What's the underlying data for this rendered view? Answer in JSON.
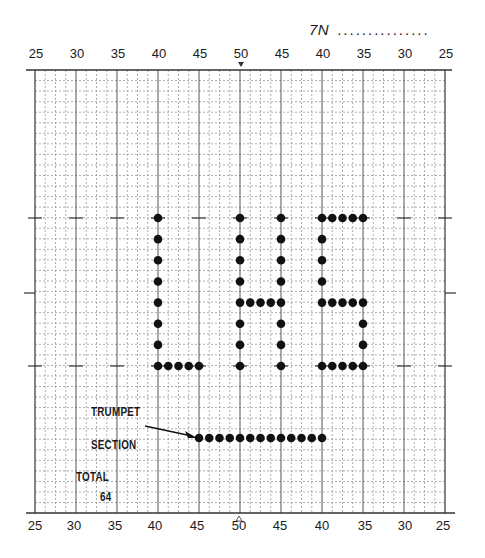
{
  "header": {
    "chart_id": "7N",
    "chart_id_blank": "..............."
  },
  "yard_labels_top": [
    "25",
    "30",
    "35",
    "40",
    "45",
    "50",
    "45",
    "40",
    "35",
    "30",
    "25"
  ],
  "yard_labels_bottom": [
    "25",
    "30",
    "35",
    "40",
    "45",
    "50",
    "45",
    "40",
    "35",
    "30",
    "25"
  ],
  "center_marker_top": "v",
  "center_marker_bottom": "^",
  "annotations": {
    "trumpet_label_line1": "TRUMPET",
    "trumpet_label_line2": "SECTION",
    "total_label": "TOTAL",
    "total_value": "64"
  },
  "chart_data": {
    "type": "scatter",
    "title": "7N",
    "x_axis": "yard line (25 to 50 to 25)",
    "y_axis": "field depth in steps (grid rows)",
    "total_performers": 64,
    "formations": [
      {
        "name": "L",
        "count": 12,
        "points": [
          {
            "yard": "40L",
            "row": 0
          },
          {
            "yard": "40L",
            "row": 1
          },
          {
            "yard": "40L",
            "row": 2
          },
          {
            "yard": "40L",
            "row": 3
          },
          {
            "yard": "40L",
            "row": 4
          },
          {
            "yard": "40L",
            "row": 5
          },
          {
            "yard": "40L",
            "row": 6
          },
          {
            "yard": "40L",
            "row": 7
          },
          {
            "yard": "41.25L",
            "row": 7
          },
          {
            "yard": "42.5L",
            "row": 7
          },
          {
            "yard": "43.75L",
            "row": 7
          },
          {
            "yard": "45L",
            "row": 7
          }
        ]
      },
      {
        "name": "H",
        "count": 19,
        "points": [
          {
            "yard": "50",
            "row": 0
          },
          {
            "yard": "50",
            "row": 1
          },
          {
            "yard": "50",
            "row": 2
          },
          {
            "yard": "50",
            "row": 3
          },
          {
            "yard": "50",
            "row": 4
          },
          {
            "yard": "50",
            "row": 5
          },
          {
            "yard": "50",
            "row": 6
          },
          {
            "yard": "50",
            "row": 7
          },
          {
            "yard": "48.75R",
            "row": 4
          },
          {
            "yard": "47.5R",
            "row": 4
          },
          {
            "yard": "46.25R",
            "row": 4
          },
          {
            "yard": "45R",
            "row": 0
          },
          {
            "yard": "45R",
            "row": 1
          },
          {
            "yard": "45R",
            "row": 2
          },
          {
            "yard": "45R",
            "row": 3
          },
          {
            "yard": "45R",
            "row": 4
          },
          {
            "yard": "45R",
            "row": 5
          },
          {
            "yard": "45R",
            "row": 6
          },
          {
            "yard": "45R",
            "row": 7
          }
        ]
      },
      {
        "name": "S",
        "count": 20,
        "points": [
          {
            "yard": "40R",
            "row": 0
          },
          {
            "yard": "38.75R",
            "row": 0
          },
          {
            "yard": "37.5R",
            "row": 0
          },
          {
            "yard": "36.25R",
            "row": 0
          },
          {
            "yard": "35R",
            "row": 0
          },
          {
            "yard": "40R",
            "row": 1
          },
          {
            "yard": "40R",
            "row": 2
          },
          {
            "yard": "40R",
            "row": 3
          },
          {
            "yard": "40R",
            "row": 4
          },
          {
            "yard": "38.75R",
            "row": 4
          },
          {
            "yard": "37.5R",
            "row": 4
          },
          {
            "yard": "36.25R",
            "row": 4
          },
          {
            "yard": "35R",
            "row": 4
          },
          {
            "yard": "35R",
            "row": 5
          },
          {
            "yard": "35R",
            "row": 6
          },
          {
            "yard": "40R",
            "row": 7
          },
          {
            "yard": "38.75R",
            "row": 7
          },
          {
            "yard": "37.5R",
            "row": 7
          },
          {
            "yard": "36.25R",
            "row": 7
          },
          {
            "yard": "35R",
            "row": 7
          }
        ]
      },
      {
        "name": "Trumpet Section",
        "count": 13,
        "row": 10.5,
        "from_yard": "45L",
        "to_yard": "40R",
        "spacing_yards": 1.25
      }
    ]
  }
}
